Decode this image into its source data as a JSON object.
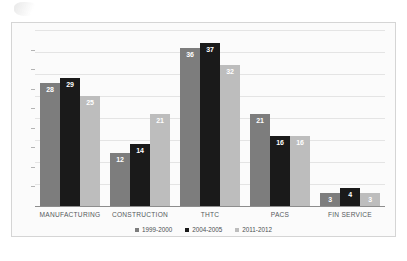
{
  "chart_data": {
    "type": "bar",
    "title": "",
    "subtitle": "",
    "xlabel": "",
    "ylabel": "",
    "ylim": [
      0,
      40
    ],
    "grid": true,
    "gridline_step": 5,
    "legend_position": "bottom",
    "categories": [
      "MANUFACTURING",
      "CONSTRUCTION",
      "THTC",
      "PACS",
      "FIN SERVICE"
    ],
    "series": [
      {
        "name": "1999-2000",
        "color": "#7d7d7d",
        "values": [
          28,
          12,
          36,
          21,
          3
        ]
      },
      {
        "name": "2004-2005",
        "color": "#1a1a1a",
        "values": [
          29,
          14,
          37,
          16,
          4
        ]
      },
      {
        "name": "2011-2012",
        "color": "#bdbdbd",
        "values": [
          25,
          21,
          32,
          16,
          3
        ]
      }
    ]
  },
  "legend": {
    "items": [
      {
        "label": "1999-2000",
        "color": "#7d7d7d"
      },
      {
        "label": "2004-2005",
        "color": "#1a1a1a"
      },
      {
        "label": "2011-2012",
        "color": "#bdbdbd"
      }
    ]
  },
  "axis": {
    "tick_count": 8
  }
}
